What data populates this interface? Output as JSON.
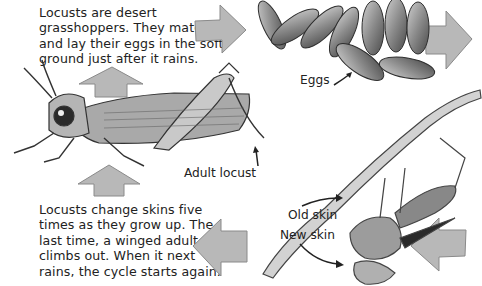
{
  "diagram": {
    "captions": {
      "intro": [
        "Locusts are desert",
        "grasshoppers. They mate",
        "and lay their eggs in the soft",
        "ground just after it rains."
      ],
      "molting": [
        "Locusts change skins five",
        "times as they grow up. The",
        "last time, a winged adult",
        "climbs out. When it next",
        "rains, the cycle starts again."
      ]
    },
    "labels": {
      "eggs": "Eggs",
      "adult": "Adult locust",
      "old_skin": "Old skin",
      "new_skin": "New skin"
    },
    "stages": [
      "Adult locust",
      "Eggs",
      "Molting nymph"
    ],
    "arrows": [
      {
        "name": "arrow-adult-to-eggs",
        "direction": "right"
      },
      {
        "name": "arrow-eggs-to-right",
        "direction": "right"
      },
      {
        "name": "arrow-into-molting",
        "direction": "left"
      },
      {
        "name": "arrow-molting-to-caption",
        "direction": "left"
      },
      {
        "name": "arrow-up-to-adult",
        "direction": "up"
      },
      {
        "name": "arrow-up-top",
        "direction": "up"
      }
    ],
    "colors": {
      "arrow_fill": "#b8b8b8",
      "arrow_stroke": "#8a8a8a",
      "text": "#222222",
      "background": "#ffffff"
    }
  }
}
